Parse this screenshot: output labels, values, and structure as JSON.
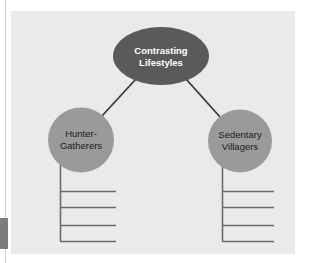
{
  "diagram": {
    "type": "hierarchy-web-organizer",
    "title_node": {
      "id": "root",
      "shape": "ellipse",
      "lines": [
        "Contrasting",
        "Lifestyles"
      ],
      "fill": "#5a5a5a",
      "text_color": "#ffffff"
    },
    "branches": [
      {
        "id": "left-branch",
        "shape": "circle",
        "lines": [
          "Hunter-",
          "Gatherers"
        ],
        "fill": "#9a9a9a",
        "text_color": "#1b1b1b",
        "blank_lines": 4
      },
      {
        "id": "right-branch",
        "shape": "circle",
        "lines": [
          "Sedentary",
          "Villagers"
        ],
        "fill": "#9a9a9a",
        "text_color": "#1b1b1b",
        "blank_lines": 4
      }
    ],
    "connector_color": "#3a3a3a",
    "rule_color": "#6b6b6b",
    "panel_color": "#eaeaea",
    "page_color": "#ffffff",
    "margin_marker_color": "#7c7c7c"
  }
}
